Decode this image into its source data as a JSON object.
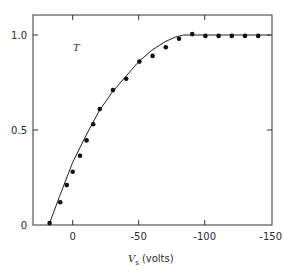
{
  "chart_data": {
    "type": "scatter",
    "title": "",
    "xlabel": "V",
    "xlabel_subscript": "s",
    "xlabel_unit": "(volts)",
    "ylabel": "",
    "annotation": "T",
    "xlim": [
      18,
      -150
    ],
    "ylim": [
      0,
      1.05
    ],
    "x_direction": "reversed (positive left, negative right)",
    "x_ticks": [
      0,
      -50,
      -100,
      -150
    ],
    "x_tick_labels": [
      "0",
      "-50",
      "-100",
      "-150"
    ],
    "y_ticks": [
      0,
      0.5,
      1.0
    ],
    "y_tick_labels": [
      "0",
      "0.5",
      "1.0"
    ],
    "grid": false,
    "legend": null,
    "series": [
      {
        "name": "measured",
        "style": "points",
        "x": [
          17.5,
          9.5,
          4.5,
          0,
          -5.5,
          -10.5,
          -15.5,
          -20.5,
          -30.5,
          -40.5,
          -50.5,
          -60.5,
          -70.5,
          -80.5,
          -90.5,
          -100.5,
          -110.5,
          -120.5,
          -130.5,
          -140.5
        ],
        "values": [
          0.01,
          0.12,
          0.21,
          0.28,
          0.365,
          0.445,
          0.53,
          0.61,
          0.71,
          0.77,
          0.86,
          0.89,
          0.935,
          0.98,
          1.005,
          0.995,
          0.995,
          0.995,
          0.995,
          0.995
        ]
      },
      {
        "name": "theory",
        "style": "line",
        "x": [
          18,
          10,
          0,
          -10,
          -20,
          -30,
          -40,
          -50,
          -60,
          -70,
          -78,
          -84,
          -100,
          -150
        ],
        "values": [
          0.0,
          0.15,
          0.33,
          0.47,
          0.6,
          0.7,
          0.78,
          0.86,
          0.92,
          0.965,
          0.99,
          1.0,
          1.0,
          1.0
        ]
      }
    ]
  }
}
